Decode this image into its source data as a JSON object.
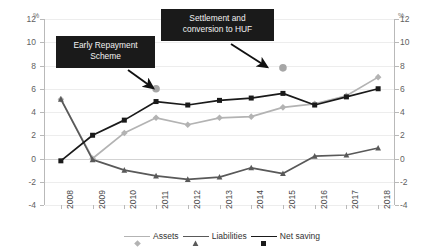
{
  "chart_data": {
    "type": "line",
    "title": "",
    "xlabel": "",
    "ylabel": "%",
    "unit_label": "%",
    "ylim": [
      -4,
      12
    ],
    "yticks": [
      12,
      10,
      8,
      6,
      4,
      2,
      0,
      -2,
      -4
    ],
    "grid": true,
    "legend_position": "bottom",
    "dual_axis": true,
    "categories": [
      "2008",
      "2009",
      "2010",
      "2011",
      "2012",
      "2013",
      "2014",
      "2015",
      "2016",
      "2017",
      "2018"
    ],
    "series": [
      {
        "name": "Assets",
        "color": "#b3b3b3",
        "marker": "diamond",
        "values": [
          5.1,
          0.0,
          2.2,
          3.5,
          2.9,
          3.5,
          3.6,
          4.4,
          4.7,
          5.4,
          7.0
        ]
      },
      {
        "name": "Liabilities",
        "color": "#595959",
        "marker": "triangle",
        "values": [
          5.1,
          -0.1,
          -1.0,
          -1.5,
          -1.8,
          -1.6,
          -0.8,
          -1.3,
          0.2,
          0.3,
          0.9
        ]
      },
      {
        "name": "Net saving",
        "color": "#1a1a1a",
        "marker": "square",
        "values": [
          -0.2,
          2.0,
          3.3,
          4.9,
          4.6,
          5.0,
          5.2,
          5.6,
          4.6,
          5.3,
          6.0
        ]
      }
    ],
    "highlight_points": [
      {
        "name": "early-repayment-point",
        "category": "2011",
        "value": 6.0,
        "color": "#a6a6a6",
        "marker": "circle"
      },
      {
        "name": "settlement-point",
        "category": "2015",
        "value": 7.8,
        "color": "#a6a6a6",
        "marker": "circle"
      }
    ],
    "annotations": [
      {
        "name": "early-repayment-scheme",
        "line1": "Early Repayment",
        "line2": "Scheme",
        "text": "Early Repayment Scheme",
        "background": "#1a1a1a",
        "color": "#f2f2f2",
        "arrow_to_category": "2011",
        "arrow_to_value": 6.0
      },
      {
        "name": "settlement-conversion-huf",
        "line1": "Settlement and",
        "line2": "conversion to HUF",
        "text": "Settlement and conversion to HUF",
        "background": "#1a1a1a",
        "color": "#f2f2f2",
        "arrow_to_category": "2015",
        "arrow_to_value": 7.8
      }
    ]
  }
}
